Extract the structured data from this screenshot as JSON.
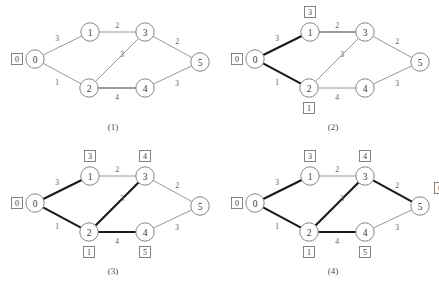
{
  "figure": {
    "title": "",
    "panel_width": 219,
    "panel_height": 144,
    "colors": {
      "background": "#ffffff",
      "thin_edge": "#8c8c8c",
      "mid_edge": "#9a9a9a",
      "bold_edge": "#1a1a1a",
      "node_stroke": "#777777",
      "node_fill": "#ffffff",
      "text": "#3a3a3a"
    },
    "node_positions": {
      "0": {
        "x": 35,
        "y": 59
      },
      "1": {
        "x": 90,
        "y": 32
      },
      "2": {
        "x": 89,
        "y": 88
      },
      "3": {
        "x": 145,
        "y": 32
      },
      "4": {
        "x": 145,
        "y": 88
      },
      "5": {
        "x": 200,
        "y": 62
      }
    },
    "node_labels": [
      "0",
      "1",
      "2",
      "3",
      "4",
      "5"
    ],
    "edges": [
      {
        "id": "0-1",
        "from": "0",
        "to": "1",
        "weight": "3",
        "wx": 57,
        "wy": 38
      },
      {
        "id": "0-2",
        "from": "0",
        "to": "2",
        "weight": "1",
        "wx": 57,
        "wy": 82
      },
      {
        "id": "1-3",
        "from": "1",
        "to": "3",
        "weight": "2",
        "wx": 117,
        "wy": 25
      },
      {
        "id": "2-3",
        "from": "2",
        "to": "3",
        "weight": "3",
        "wx": 122,
        "wy": 54
      },
      {
        "id": "2-4",
        "from": "2",
        "to": "4",
        "weight": "4",
        "wx": 117,
        "wy": 97
      },
      {
        "id": "3-5",
        "from": "3",
        "to": "5",
        "weight": "2",
        "wx": 177,
        "wy": 41
      },
      {
        "id": "4-5",
        "from": "4",
        "to": "5",
        "weight": "3",
        "wx": 177,
        "wy": 83
      }
    ],
    "dist_box_offsets": {
      "0": {
        "dx": -18,
        "dy": 0
      },
      "1": {
        "dx": 0,
        "dy": -20
      },
      "2": {
        "dx": 0,
        "dy": 20
      },
      "3": {
        "dx": 0,
        "dy": -20
      },
      "4": {
        "dx": 0,
        "dy": 20
      },
      "5": {
        "dx": 20,
        "dy": -18
      }
    },
    "panels": [
      {
        "id": "panel-1",
        "caption": "(1)",
        "origin": {
          "x": 0,
          "y": 0
        },
        "caption_pos": {
          "x": 113,
          "y": 127
        },
        "edge_styles": {
          "0-1": "thin",
          "0-2": "thin",
          "1-3": "thin",
          "2-3": "thin",
          "2-4": "mid",
          "3-5": "thin",
          "4-5": "thin"
        },
        "dist_boxes": [
          {
            "node": "0",
            "value": "0"
          }
        ]
      },
      {
        "id": "panel-2",
        "caption": "(2)",
        "origin": {
          "x": 220,
          "y": 0
        },
        "caption_pos": {
          "x": 113,
          "y": 127
        },
        "edge_styles": {
          "0-1": "bold",
          "0-2": "bold",
          "1-3": "mid",
          "2-3": "thin",
          "2-4": "thin",
          "3-5": "thin",
          "4-5": "thin"
        },
        "dist_boxes": [
          {
            "node": "0",
            "value": "0"
          },
          {
            "node": "1",
            "value": "3"
          },
          {
            "node": "2",
            "value": "1"
          }
        ]
      },
      {
        "id": "panel-3",
        "caption": "(3)",
        "origin": {
          "x": 0,
          "y": 144
        },
        "caption_pos": {
          "x": 113,
          "y": 127
        },
        "edge_styles": {
          "0-1": "bold",
          "0-2": "bold",
          "1-3": "thin",
          "2-3": "bold",
          "2-4": "bold",
          "3-5": "thin",
          "4-5": "thin"
        },
        "dist_boxes": [
          {
            "node": "0",
            "value": "0"
          },
          {
            "node": "1",
            "value": "3"
          },
          {
            "node": "2",
            "value": "1"
          },
          {
            "node": "3",
            "value": "4"
          },
          {
            "node": "4",
            "value": "5"
          }
        ]
      },
      {
        "id": "panel-4",
        "caption": "(4)",
        "origin": {
          "x": 220,
          "y": 144
        },
        "caption_pos": {
          "x": 113,
          "y": 127
        },
        "edge_styles": {
          "0-1": "bold",
          "0-2": "bold",
          "1-3": "thin",
          "2-3": "bold",
          "2-4": "bold",
          "3-5": "bold",
          "4-5": "thin"
        },
        "dist_boxes": [
          {
            "node": "0",
            "value": "0"
          },
          {
            "node": "1",
            "value": "3"
          },
          {
            "node": "2",
            "value": "1"
          },
          {
            "node": "3",
            "value": "4"
          },
          {
            "node": "4",
            "value": "5"
          },
          {
            "node": "5",
            "value": "6"
          }
        ]
      }
    ]
  },
  "chart_data": {
    "type": "diagram",
    "nodes": [
      "0",
      "1",
      "2",
      "3",
      "4",
      "5"
    ],
    "edges": [
      {
        "u": "0",
        "v": "1",
        "w": 3
      },
      {
        "u": "0",
        "v": "2",
        "w": 1
      },
      {
        "u": "1",
        "v": "3",
        "w": 2
      },
      {
        "u": "2",
        "v": "3",
        "w": 3
      },
      {
        "u": "2",
        "v": "4",
        "w": 4
      },
      {
        "u": "3",
        "v": "5",
        "w": 2
      },
      {
        "u": "4",
        "v": "5",
        "w": 3
      }
    ],
    "steps": [
      {
        "caption": "(1)",
        "distances": {
          "0": 0
        },
        "tree_edges": []
      },
      {
        "caption": "(2)",
        "distances": {
          "0": 0,
          "1": 3,
          "2": 1
        },
        "tree_edges": [
          "0-1",
          "0-2"
        ]
      },
      {
        "caption": "(3)",
        "distances": {
          "0": 0,
          "1": 3,
          "2": 1,
          "3": 4,
          "4": 5
        },
        "tree_edges": [
          "0-1",
          "0-2",
          "2-3",
          "2-4"
        ]
      },
      {
        "caption": "(4)",
        "distances": {
          "0": 0,
          "1": 3,
          "2": 1,
          "3": 4,
          "4": 5,
          "5": 6
        },
        "tree_edges": [
          "0-1",
          "0-2",
          "2-3",
          "2-4",
          "3-5"
        ]
      }
    ]
  }
}
